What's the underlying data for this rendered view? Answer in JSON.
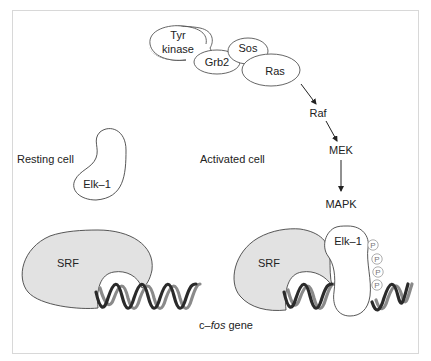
{
  "diagram": {
    "title_labels": {
      "resting": "Resting cell",
      "activated": "Activated cell",
      "gene": "c–",
      "gene_italic": "fos",
      "gene_suffix": " gene"
    },
    "receptor_complex": {
      "tyr_line1": "Tyr",
      "tyr_line2": "kinase",
      "grb2": "Grb2",
      "sos": "Sos",
      "ras": "Ras"
    },
    "cascade": [
      "Raf",
      "MEK",
      "MAPK"
    ],
    "resting": {
      "elk": "Elk–1",
      "srf": "SRF"
    },
    "activated": {
      "elk": "Elk–1",
      "srf": "SRF",
      "phosphates": [
        "P",
        "P",
        "P",
        "P"
      ]
    },
    "colors": {
      "frame": "#d8d8d8",
      "protein_fill": "#e2e2e2",
      "outline": "#444444",
      "dna_dark": "#2a2a2a",
      "dna_gray": "#8a8a8a"
    }
  }
}
